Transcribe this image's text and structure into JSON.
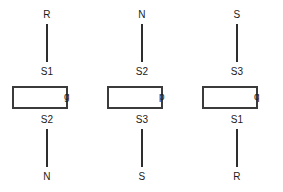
{
  "diagram": {
    "background_color": "#ffffff",
    "line_color": "#2e2e2e",
    "box_border_color": "#3b3b3b",
    "box_fill_color": "#ffffff",
    "text_color": "#1b1b1b",
    "blocks": [
      {
        "name": "phase-g",
        "top_terminal": "R",
        "top_pin": "S1",
        "side_label": "g",
        "bottom_pin": "S2",
        "bottom_terminal": "N"
      },
      {
        "name": "phase-p",
        "top_terminal": "N",
        "top_pin": "S2",
        "side_label": "p",
        "bottom_pin": "S3",
        "bottom_terminal": "S"
      },
      {
        "name": "phase-q",
        "top_terminal": "S",
        "top_pin": "S3",
        "side_label": "q",
        "bottom_pin": "S1",
        "bottom_terminal": "R"
      }
    ]
  }
}
